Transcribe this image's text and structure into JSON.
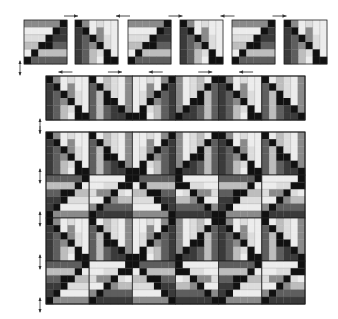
{
  "diagram": {
    "title": "",
    "colors": {
      "black": "#111111",
      "dark": "#3a3a3a",
      "mid_dark": "#5e5e5e",
      "mid": "#8a8a8a",
      "light": "#bdbdbd",
      "lighter": "#dcdcdc",
      "lightest": "#ececec",
      "outline": "#222222",
      "arrow": "#333333"
    },
    "block_types": {
      "A": {
        "orientation": "horizontal-strips",
        "grid": 6,
        "cells": [
          [
            "M",
            "M",
            "M",
            "M",
            "M",
            "K"
          ],
          [
            "W",
            "W",
            "W",
            "W",
            "K",
            "D"
          ],
          [
            "L",
            "L",
            "L",
            "K",
            "D",
            "D"
          ],
          [
            "V",
            "V",
            "K",
            "K",
            "N",
            "N"
          ],
          [
            "W",
            "K",
            "G",
            "G",
            "G",
            "G"
          ],
          [
            "K",
            "N",
            "N",
            "N",
            "N",
            "N"
          ]
        ]
      },
      "B": {
        "orientation": "vertical-strips",
        "grid": 6,
        "cells": [
          [
            "K",
            "M",
            "W",
            "L",
            "W",
            "W"
          ],
          [
            "D",
            "K",
            "W",
            "M",
            "W",
            "W"
          ],
          [
            "D",
            "N",
            "K",
            "M",
            "L",
            "W"
          ],
          [
            "D",
            "N",
            "M",
            "K",
            "L",
            "W"
          ],
          [
            "D",
            "N",
            "G",
            "L",
            "K",
            "W"
          ],
          [
            "D",
            "N",
            "G",
            "W",
            "K",
            "K"
          ]
        ]
      }
    },
    "row_of_blocks": {
      "label": "Row assembly",
      "blocks": [
        {
          "type": "A",
          "rotate": 0
        },
        {
          "type": "B",
          "rotate": 0
        },
        {
          "type": "A",
          "rotate": 0
        },
        {
          "type": "B",
          "rotate": 0
        },
        {
          "type": "A",
          "rotate": 0
        },
        {
          "type": "B",
          "rotate": 0
        }
      ],
      "arrows": [
        {
          "dir": "right"
        },
        {
          "dir": "left"
        },
        {
          "dir": "right"
        },
        {
          "dir": "left"
        },
        {
          "dir": "right"
        }
      ]
    },
    "sewn_strip": {
      "label": "Sewn row",
      "columns": 6,
      "arrows": [
        {
          "dir": "left"
        },
        {
          "dir": "right"
        },
        {
          "dir": "left"
        },
        {
          "dir": "right"
        },
        {
          "dir": "left"
        }
      ]
    },
    "quilt_top": {
      "label": "Quilt top",
      "rows": 4,
      "columns": 6,
      "side_arrows": 4
    }
  }
}
